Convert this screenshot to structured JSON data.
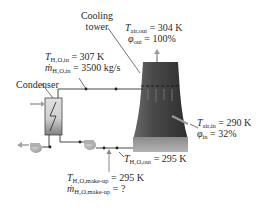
{
  "diagram": {
    "components": {
      "cooling_tower": {
        "label_line1": "Cooling",
        "label_line2": "tower"
      },
      "condenser": {
        "label": "Condenser"
      }
    },
    "labels": {
      "air_out": {
        "temp_symbol": "T",
        "temp_sub": "air,out",
        "temp_value": "= 304 K",
        "rh_symbol": "φ",
        "rh_sub": "out",
        "rh_value": "= 100%"
      },
      "water_in": {
        "temp_symbol": "T",
        "temp_sub": "H₂O,in",
        "temp_value": "= 307 K",
        "flow_symbol": "ṁ",
        "flow_sub": "H₂O,in",
        "flow_value": "= 3500 kg/s"
      },
      "air_in": {
        "temp_symbol": "T",
        "temp_sub": "air,in",
        "temp_value": "= 290 K",
        "rh_symbol": "φ",
        "rh_sub": "in",
        "rh_value": "= 32%"
      },
      "water_out": {
        "temp_symbol": "T",
        "temp_sub": "H₂O,out",
        "temp_value": "= 295 K"
      },
      "makeup": {
        "temp_symbol": "T",
        "temp_sub": "H₂O,make-up",
        "temp_value": "= 295 K",
        "flow_symbol": "ṁ",
        "flow_sub": "H₂O,make-up",
        "flow_value": "= ?"
      }
    },
    "colors": {
      "tower_dark": "#3c3c3c",
      "tower_light": "#a8a8a8",
      "pipe": "#333333",
      "pump_fill": "#b8b8b8",
      "arrow_fill": "#a0a0a0"
    }
  }
}
